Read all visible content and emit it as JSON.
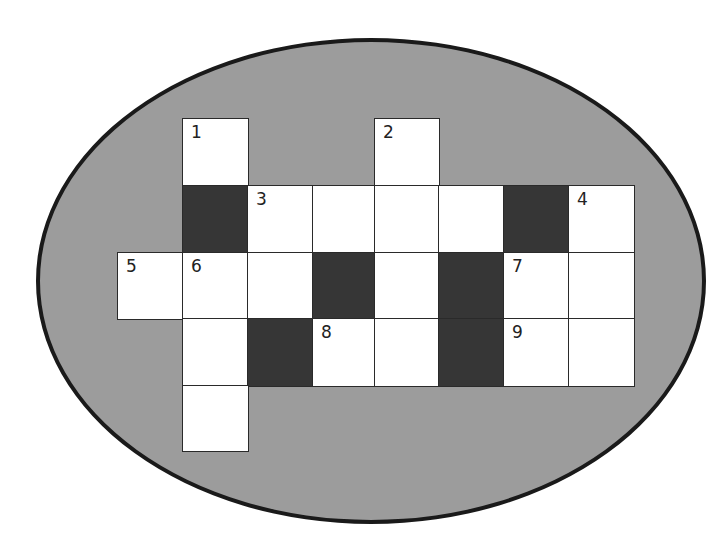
{
  "puzzle": {
    "type": "crossword",
    "background_shape": "ellipse",
    "colors": {
      "page": "#ffffff",
      "ellipse_fill": "#9c9c9c",
      "ellipse_border": "#1a1a1a",
      "white_cell": "#ffffff",
      "black_cell": "#363636"
    },
    "columns_x": [
      117,
      182,
      247,
      312,
      374,
      438,
      503,
      568,
      633
    ],
    "rows_y": [
      118,
      185,
      252,
      318,
      385,
      450
    ],
    "cells": [
      {
        "row": 0,
        "col": 1,
        "type": "white",
        "number": "1"
      },
      {
        "row": 0,
        "col": 4,
        "type": "white",
        "number": "2"
      },
      {
        "row": 1,
        "col": 1,
        "type": "black",
        "number": ""
      },
      {
        "row": 1,
        "col": 2,
        "type": "white",
        "number": "3"
      },
      {
        "row": 1,
        "col": 3,
        "type": "white",
        "number": ""
      },
      {
        "row": 1,
        "col": 4,
        "type": "white",
        "number": ""
      },
      {
        "row": 1,
        "col": 5,
        "type": "white",
        "number": ""
      },
      {
        "row": 1,
        "col": 6,
        "type": "black",
        "number": ""
      },
      {
        "row": 1,
        "col": 7,
        "type": "white",
        "number": "4"
      },
      {
        "row": 2,
        "col": 0,
        "type": "white",
        "number": "5"
      },
      {
        "row": 2,
        "col": 1,
        "type": "white",
        "number": "6"
      },
      {
        "row": 2,
        "col": 2,
        "type": "white",
        "number": ""
      },
      {
        "row": 2,
        "col": 3,
        "type": "black",
        "number": ""
      },
      {
        "row": 2,
        "col": 4,
        "type": "white",
        "number": ""
      },
      {
        "row": 2,
        "col": 5,
        "type": "black",
        "number": ""
      },
      {
        "row": 2,
        "col": 6,
        "type": "white",
        "number": "7"
      },
      {
        "row": 2,
        "col": 7,
        "type": "white",
        "number": ""
      },
      {
        "row": 3,
        "col": 1,
        "type": "white",
        "number": ""
      },
      {
        "row": 3,
        "col": 2,
        "type": "black",
        "number": ""
      },
      {
        "row": 3,
        "col": 3,
        "type": "white",
        "number": "8"
      },
      {
        "row": 3,
        "col": 4,
        "type": "white",
        "number": ""
      },
      {
        "row": 3,
        "col": 5,
        "type": "black",
        "number": ""
      },
      {
        "row": 3,
        "col": 6,
        "type": "white",
        "number": "9"
      },
      {
        "row": 3,
        "col": 7,
        "type": "white",
        "number": ""
      },
      {
        "row": 4,
        "col": 1,
        "type": "white",
        "number": ""
      }
    ]
  }
}
